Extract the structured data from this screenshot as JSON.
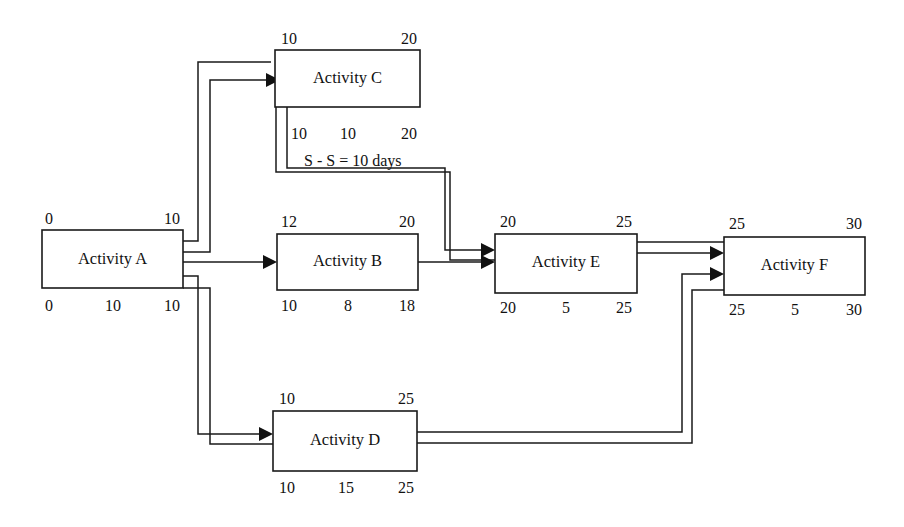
{
  "diagram": {
    "type": "precedence-network-diagram",
    "note": {
      "text": "S - S = 10 days",
      "relationship": "start-to-start",
      "lag_days": 10
    },
    "nodes": [
      {
        "id": "A",
        "label": "Activity A",
        "early_start": "0",
        "early_finish": "10",
        "late_start": "0",
        "duration": "10",
        "late_finish": "10"
      },
      {
        "id": "B",
        "label": "Activity B",
        "early_start": "12",
        "early_finish": "20",
        "late_start": "10",
        "duration": "8",
        "late_finish": "18"
      },
      {
        "id": "C",
        "label": "Activity C",
        "early_start": "10",
        "early_finish": "20",
        "late_start": "10",
        "duration": "10",
        "late_finish": "20"
      },
      {
        "id": "D",
        "label": "Activity D",
        "early_start": "10",
        "early_finish": "25",
        "late_start": "10",
        "duration": "15",
        "late_finish": "25"
      },
      {
        "id": "E",
        "label": "Activity E",
        "early_start": "20",
        "early_finish": "25",
        "late_start": "20",
        "duration": "5",
        "late_finish": "25"
      },
      {
        "id": "F",
        "label": "Activity F",
        "early_start": "25",
        "early_finish": "30",
        "late_start": "25",
        "duration": "5",
        "late_finish": "30"
      }
    ],
    "edges": [
      {
        "from": "A",
        "to": "C"
      },
      {
        "from": "A",
        "to": "B"
      },
      {
        "from": "A",
        "to": "D"
      },
      {
        "from": "C",
        "to": "E"
      },
      {
        "from": "B",
        "to": "E"
      },
      {
        "from": "E",
        "to": "F"
      },
      {
        "from": "D",
        "to": "F"
      }
    ],
    "colors": {
      "line": "#1a1a1a",
      "text": "#111111",
      "background": "#ffffff"
    }
  }
}
